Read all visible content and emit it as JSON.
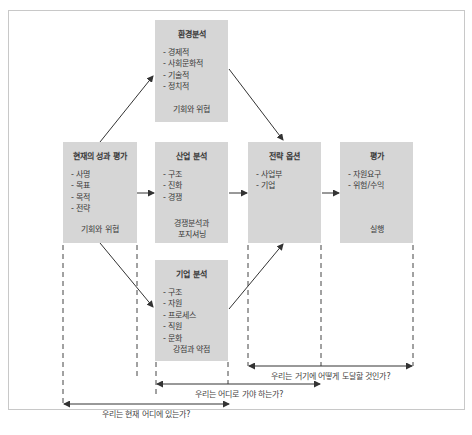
{
  "diagram": {
    "boxes": {
      "environment": {
        "title": "환경분석",
        "items": [
          "경제적",
          "사회문화적",
          "기술적",
          "정치적"
        ],
        "footer": "기회와 위협"
      },
      "current": {
        "title": "현재의 성과 평가",
        "items": [
          "사명",
          "목표",
          "목적",
          "전략"
        ],
        "footer": "기회와 위협"
      },
      "industry": {
        "title": "산업 분석",
        "items": [
          "구조",
          "진화",
          "경쟁"
        ],
        "footer_line1": "경쟁분석과",
        "footer_line2": "포지셔닝"
      },
      "strategy": {
        "title": "전략 옵션",
        "items": [
          "사업부",
          "기업"
        ]
      },
      "evaluation": {
        "title": "평가",
        "items": [
          "자원요구",
          "위험/수익"
        ],
        "footer": "실행"
      },
      "company": {
        "title": "기업 분석",
        "items": [
          "구조",
          "자원",
          "프로세스",
          "직원",
          "문화"
        ],
        "footer": "강점과 약점"
      }
    },
    "questions": {
      "how_get_there": "우리는 거기에 어떻게 도달할 것인가?",
      "where_go": "우리는 어디로 가야 하는가?",
      "where_now": "우리는 현재 어디에 있는가?"
    },
    "colors": {
      "box_fill": "#d6d6d6",
      "line": "#333333",
      "frame_border": "#c8c8c8"
    }
  }
}
